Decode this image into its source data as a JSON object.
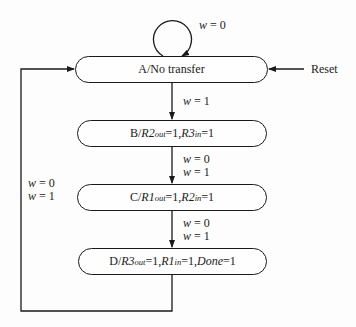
{
  "diagram": {
    "type": "state-machine",
    "states": [
      {
        "id": "A",
        "name": "A",
        "output_text": "No transfer",
        "outputs": []
      },
      {
        "id": "B",
        "name": "B",
        "outputs": [
          {
            "sig": "R2",
            "sub": "out",
            "val": "1"
          },
          {
            "sig": "R3",
            "sub": "in",
            "val": "1"
          }
        ]
      },
      {
        "id": "C",
        "name": "C",
        "outputs": [
          {
            "sig": "R1",
            "sub": "out",
            "val": "1"
          },
          {
            "sig": "R2",
            "sub": "in",
            "val": "1"
          }
        ]
      },
      {
        "id": "D",
        "name": "D",
        "outputs": [
          {
            "sig": "R3",
            "sub": "out",
            "val": "1"
          },
          {
            "sig": "R1",
            "sub": "in",
            "val": "1"
          },
          {
            "sig": "Done",
            "sub": "",
            "val": "1"
          }
        ]
      }
    ],
    "transitions": [
      {
        "from": "A",
        "to": "A",
        "conditions": [
          "w = 0"
        ]
      },
      {
        "from": "A",
        "to": "B",
        "conditions": [
          "w = 1"
        ]
      },
      {
        "from": "B",
        "to": "C",
        "conditions": [
          "w = 0",
          "w = 1"
        ]
      },
      {
        "from": "C",
        "to": "D",
        "conditions": [
          "w = 0",
          "w = 1"
        ]
      },
      {
        "from": "D",
        "to": "A",
        "conditions": [
          "w = 0",
          "w = 1"
        ]
      }
    ],
    "reset": {
      "label": "Reset",
      "target": "A"
    }
  },
  "labels": {
    "w": "w",
    "eq0": " = 0",
    "eq1": " = 1",
    "slash": "/",
    "eq": " = ",
    "comma": ", ",
    "one": "1",
    "reset": "Reset",
    "a_name": "A",
    "a_output": "No transfer",
    "b_name": "B",
    "b_sig1": "R2",
    "b_sub1": "out",
    "b_sig2": "R3",
    "b_sub2": "in",
    "c_name": "C",
    "c_sig1": "R1",
    "c_sub1": "out",
    "c_sig2": "R2",
    "c_sub2": "in",
    "d_name": "D",
    "d_sig1": "R3",
    "d_sub1": "out",
    "d_sig2": "R1",
    "d_sub2": "in",
    "d_sig3": "Done"
  },
  "colors": {
    "line": "#1a1a1a",
    "background": "#fdfdfd"
  }
}
